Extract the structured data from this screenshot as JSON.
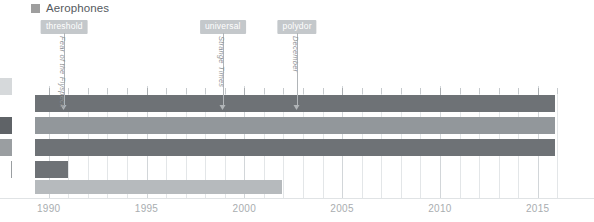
{
  "legend": {
    "icon": "square-swatch-icon",
    "label": "Aerophones",
    "color": "#9e9e9e"
  },
  "annotations": [
    {
      "badge": "threshold",
      "album": "Fear of the Flyspeck",
      "year": 1990.8
    },
    {
      "badge": "universal",
      "album": "Strange Times",
      "year": 1998.9
    },
    {
      "badge": "polydor",
      "album": "December",
      "year": 2002.7
    }
  ],
  "axis": {
    "min": 1989.3,
    "max": 2016.6,
    "tick_labels": [
      "1990",
      "1995",
      "2000",
      "2005",
      "2010",
      "2015"
    ],
    "tick_values": [
      1990,
      1995,
      2000,
      2005,
      2010,
      2015
    ],
    "minor_step": 1,
    "grid": true
  },
  "chart_data": {
    "type": "bar",
    "orientation": "horizontal",
    "title": "",
    "xlabel": "",
    "ylabel": "",
    "xlim": [
      1989.3,
      2016.6
    ],
    "grid": true,
    "legend_position": "top-left",
    "categories": [
      "row-1",
      "row-2",
      "row-3",
      "row-4",
      "row-5"
    ],
    "bars": [
      {
        "name": "row-1",
        "start": 1989.3,
        "end": 2015.9,
        "color": "#6e7276",
        "edge_color": "#c9cccf"
      },
      {
        "name": "row-2",
        "start": 1989.3,
        "end": 2015.9,
        "color": "#92979b",
        "edge_color": "#5f6367"
      },
      {
        "name": "row-3",
        "start": 1989.3,
        "end": 2015.9,
        "color": "#6e7276",
        "edge_color": "#8d9194"
      },
      {
        "name": "row-4",
        "start": 1989.3,
        "end": 1991.0,
        "color": "#6e7276",
        "edge_color": "#ffffff"
      },
      {
        "name": "row-5",
        "start": 1989.3,
        "end": 2001.9,
        "color": "#b6babd",
        "edge_color": "#ffffff"
      }
    ],
    "values": [
      26.6,
      26.6,
      26.6,
      1.7,
      12.6
    ]
  }
}
